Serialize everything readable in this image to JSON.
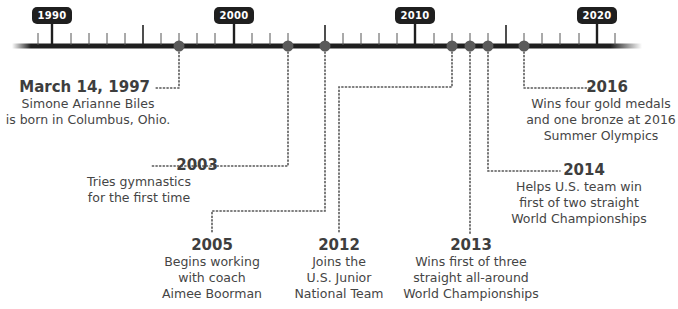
{
  "timeline": {
    "title": "Simone Biles timeline",
    "colors": {
      "axis": "#1f1f1f",
      "marker": "#5a5a5a",
      "connector": "#555555",
      "badge_bg": "#1f1f1f",
      "badge_text": "#ffffff",
      "text": "#454545"
    },
    "decade_labels": [
      {
        "label": "1990",
        "year": 1990
      },
      {
        "label": "2000",
        "year": 2000
      },
      {
        "label": "2010",
        "year": 2010
      },
      {
        "label": "2020",
        "year": 2020
      }
    ],
    "range": {
      "start": 1987,
      "end": 2022
    },
    "events": [
      {
        "year_label": "March 14, 1997",
        "year": 1997.2,
        "description": "Simone Arianne Biles\nis born in Columbus, Ohio."
      },
      {
        "year_label": "2003",
        "year": 2003,
        "description": "Tries gymnastics\nfor the first time"
      },
      {
        "year_label": "2005",
        "year": 2005,
        "description": "Begins working\nwith coach\nAimee Boorman"
      },
      {
        "year_label": "2012",
        "year": 2012,
        "description": "Joins the\nU.S. Junior\nNational Team"
      },
      {
        "year_label": "2013",
        "year": 2013,
        "description": "Wins first of three\nstraight all-around\nWorld Championships"
      },
      {
        "year_label": "2014",
        "year": 2014,
        "description": "Helps U.S. team win\nfirst of two straight\nWorld Championships"
      },
      {
        "year_label": "2016",
        "year": 2016,
        "description": "Wins four gold medals\nand one bronze at 2016\nSummer Olympics"
      }
    ]
  }
}
